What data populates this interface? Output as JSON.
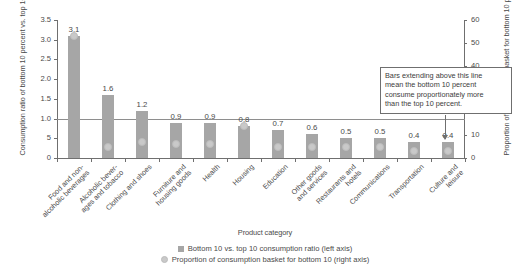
{
  "chart_data": {
    "type": "bar",
    "title": "",
    "xlabel": "Product category",
    "ylabel_left": "Consumption ratio of\nbottom 10 percent vs. top 10 percent",
    "ylabel_right": "Proportion of consumption basket\nfor bottom 10 percent",
    "categories": [
      "Food and non-\nalcoholic beverages",
      "Alcoholic bever-\nages and tobacco",
      "Clothing and shoes",
      "Furniture and\nhousing goods",
      "Health",
      "Housing",
      "Education",
      "Other goods\nand services",
      "Restaurants and\nhotels",
      "Communications",
      "Transportation",
      "Culture and\nleisure"
    ],
    "series": [
      {
        "name": "Bottom 10 vs. top 10 consumption ratio (left axis)",
        "axis": "left",
        "type": "bar",
        "color": "#a6a6a6",
        "values": [
          3.1,
          1.6,
          1.2,
          0.9,
          0.9,
          0.8,
          0.7,
          0.6,
          0.5,
          0.5,
          0.4,
          0.4
        ],
        "labels": [
          "3.1",
          "1.6",
          "1.2",
          "0.9",
          "0.9",
          "0.8",
          "0.7",
          "0.6",
          "0.5",
          "0.5",
          "0.4",
          "0.4"
        ]
      },
      {
        "name": "Proportion of consumption basket for bottom 10 (right axis)",
        "axis": "right",
        "type": "scatter",
        "color": "#c9c9c9",
        "values": [
          53,
          5,
          7,
          6,
          6,
          14,
          5,
          5,
          5,
          5,
          3,
          3
        ]
      }
    ],
    "ylim_left": [
      0,
      3.5
    ],
    "ytick_left": [
      "0",
      "5",
      "1.0",
      "1.5",
      "2.0",
      "2.5",
      "3.0",
      "3.5"
    ],
    "ytick_left_values": [
      0,
      0.5,
      1.0,
      1.5,
      2.0,
      2.5,
      3.0,
      3.5
    ],
    "ylim_right": [
      0,
      60
    ],
    "ytick_right": [
      "0",
      "10",
      "20",
      "30",
      "40",
      "50",
      "60"
    ],
    "ytick_right_values": [
      0,
      10,
      20,
      30,
      40,
      50,
      60
    ],
    "grid": false,
    "reference_line": {
      "axis": "left",
      "value": 1.0,
      "color": "#8e8e8e"
    },
    "annotation": {
      "text": "Bars extending above this line mean the bottom 10 percent consume proportionately more than the top 10 percent.",
      "line1": "Bars extending above this line",
      "line2": "mean the bottom 10 percent",
      "line3": "consume proportionately more",
      "line4": "than the top 10 percent."
    },
    "legend_position": "bottom"
  }
}
